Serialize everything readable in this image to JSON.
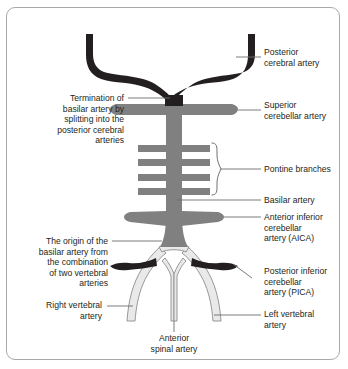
{
  "figure": {
    "type": "anatomical-diagram",
    "width": 348,
    "height": 369
  },
  "colors": {
    "background": "#ffffff",
    "panel_border": "#a9a9a9",
    "artery_dark": "#231f20",
    "artery_mid_gray": "#808080",
    "artery_light_gray": "#e9e9e9",
    "artery_light_outline": "#8c8c8c",
    "leader_line": "#6e6e6e",
    "text": "#231f20"
  },
  "labels": {
    "posterior_cerebral_artery": "Posterior\ncerebral artery",
    "superior_cerebellar_artery": "Superior\ncerebellar artery",
    "pontine_branches": "Pontine branches",
    "basilar_artery": "Basilar artery",
    "aica": "Anterior inferior\ncerebellar\nartery (AICA)",
    "pica": "Posterior inferior\ncerebellar\nartery (PICA)",
    "left_vertebral_artery": "Left vertebral\nartery",
    "termination_of_basilar": "Termination of\nbasilar artery by\nsplitting into the\nposterior cerebral\narteries",
    "origin_of_basilar": "The origin of the\nbasilar artery from\nthe combination\nof two vertebral\narteries",
    "right_vertebral_artery": "Right vertebral\nartery",
    "anterior_spinal_artery": "Anterior\nspinal artery"
  },
  "structures": [
    {
      "name": "posterior-cerebral-artery",
      "color": "dark",
      "side": "both"
    },
    {
      "name": "superior-cerebellar-artery",
      "color": "mid-gray",
      "side": "both"
    },
    {
      "name": "pontine-branches",
      "color": "mid-gray",
      "count": 8,
      "pairs": 4
    },
    {
      "name": "basilar-artery",
      "color": "mid-gray",
      "side": "midline"
    },
    {
      "name": "anterior-inferior-cerebellar-artery",
      "color": "mid-gray",
      "side": "both"
    },
    {
      "name": "posterior-inferior-cerebellar-artery",
      "color": "dark",
      "side": "both"
    },
    {
      "name": "vertebral-artery",
      "color": "light-gray",
      "side": "both"
    },
    {
      "name": "anterior-spinal-artery",
      "color": "light-gray",
      "side": "midline"
    }
  ]
}
